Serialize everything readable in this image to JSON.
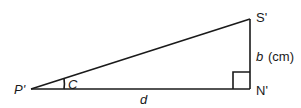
{
  "diagram": {
    "type": "right-triangle",
    "vertices": {
      "P": {
        "label": "P'"
      },
      "N": {
        "label": "N'"
      },
      "S": {
        "label": "S'"
      }
    },
    "angle_label": "C",
    "base_label": "d",
    "height_label_var": "b",
    "height_label_unit": "(cm)",
    "right_angle_at": "N'",
    "stroke_color": "#1a1a1a",
    "background": "#ffffff"
  }
}
